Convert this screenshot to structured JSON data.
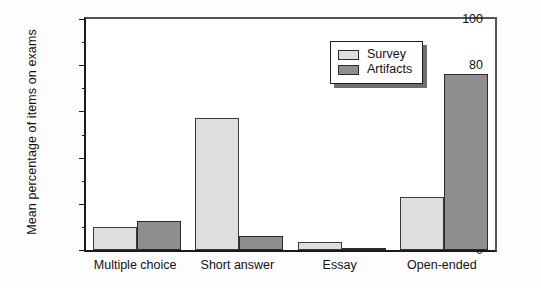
{
  "chart_data": {
    "type": "bar",
    "title": "",
    "subtitle": "",
    "xlabel": "",
    "ylabel": "Mean percentage of items on exams",
    "categories": [
      "Multiple choice",
      "Short answer",
      "Essay",
      "Open-ended"
    ],
    "series": [
      {
        "name": "Survey",
        "values": [
          10,
          57,
          3.5,
          23
        ],
        "color": "#dededd"
      },
      {
        "name": "Artifacts",
        "values": [
          12.5,
          6,
          0.3,
          76
        ],
        "color": "#8e8e8e"
      }
    ],
    "ylim": [
      0,
      100
    ],
    "yticks": [
      0,
      20,
      40,
      60,
      80,
      100
    ],
    "ytick_labels": [
      "0",
      "20",
      "40",
      "60",
      "80",
      "100"
    ],
    "yminor_ticks": [
      10,
      30,
      50,
      70,
      90
    ],
    "grid": false,
    "legend_position": "top-right",
    "legend_entries": [
      "Survey",
      "Artifacts"
    ]
  },
  "axis": {
    "y_title": "Mean percentage of items on exams",
    "y_labels": {
      "0": "0",
      "1": "20",
      "2": "40",
      "3": "60",
      "4": "80",
      "5": "100"
    },
    "x_labels": {
      "0": "Multiple choice",
      "1": "Short answer",
      "2": "Essay",
      "3": "Open-ended"
    }
  },
  "legend": {
    "items": [
      {
        "label": "Survey"
      },
      {
        "label": "Artifacts"
      }
    ]
  }
}
